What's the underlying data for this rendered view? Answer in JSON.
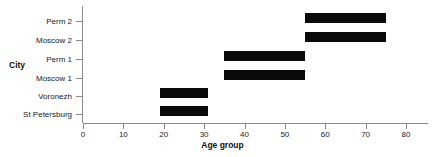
{
  "chart_data": {
    "type": "bar",
    "orientation": "horizontal",
    "subtype": "range-bar",
    "title": "",
    "xlabel": "Age group",
    "ylabel": "City",
    "xlim": [
      0,
      80
    ],
    "xticks": [
      0,
      10,
      20,
      30,
      40,
      50,
      60,
      70,
      80
    ],
    "xticklabels": [
      "0",
      "10",
      "20",
      "30",
      "40",
      "50",
      "60",
      "70",
      "80"
    ],
    "grid": false,
    "legend": false,
    "bar_color": "#0a0a0a",
    "axis_color": "#8a8a8a",
    "categories": [
      "St Petersburg",
      "Voronezh",
      "Moscow 1",
      "Perm 1",
      "Moscow 2",
      "Perm 2"
    ],
    "bars": [
      {
        "category": "Perm 2",
        "start": 55,
        "end": 75
      },
      {
        "category": "Moscow 2",
        "start": 55,
        "end": 75
      },
      {
        "category": "Perm 1",
        "start": 35,
        "end": 55
      },
      {
        "category": "Moscow 1",
        "start": 35,
        "end": 55
      },
      {
        "category": "Voronezh",
        "start": 19,
        "end": 31
      },
      {
        "category": "St Petersburg",
        "start": 19,
        "end": 31
      }
    ]
  }
}
